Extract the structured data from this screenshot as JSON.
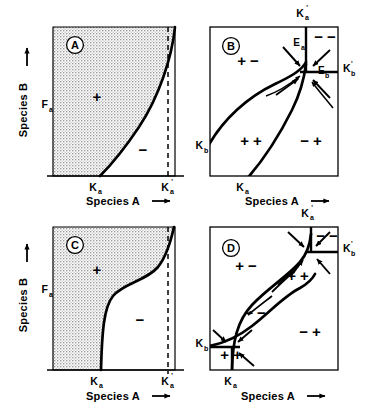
{
  "figure": {
    "type": "multi-panel-diagram",
    "panel_count": 4,
    "background_color": "#ffffff",
    "line_color": "#000000",
    "stipple_color": "#b4b4b4"
  },
  "axes": {
    "x_title": "Species A",
    "y_title": "Species B",
    "x_arrow": "⟶",
    "y_arrow": "⟶",
    "y_tick": "F",
    "y_tick_sub": "a",
    "k_a": "K",
    "k_a_sub": "a",
    "k_a_prime": "K",
    "k_a_prime_sub": "a",
    "k_a_prime_mark": "'",
    "k_b": "K",
    "k_b_sub": "b",
    "k_b_prime": "K",
    "k_b_prime_sub": "b",
    "k_b_prime_mark": "'"
  },
  "panels": [
    {
      "id": "A",
      "letter": "A",
      "kind": "single-isocline-shaded",
      "description": "Concave isocline rising from K_a on the x-axis to the top-right; region left of curve stippled and marked +, region right marked -, dashed vertical line at K'_a",
      "regions": [
        {
          "name": "positive-region",
          "sign": "+",
          "shaded": true
        },
        {
          "name": "negative-region",
          "sign": "−",
          "shaded": false
        }
      ],
      "x_ticks": [
        {
          "label": "K",
          "sub": "a",
          "prime": false
        },
        {
          "label": "K",
          "sub": "a",
          "prime": true
        }
      ],
      "y_ticks": [
        {
          "label": "F",
          "sub": "a"
        }
      ],
      "dashed_line_at": "K'_a",
      "x_title": "Species A",
      "y_title": "Species B"
    },
    {
      "id": "B",
      "letter": "B",
      "kind": "two-isoclines-stable-node",
      "description": "Two isoclines crossing at a single stable equilibrium near the top-right; four quadrant sign regions; arrows converge on the equilibrium",
      "regions": [
        {
          "name": "region-plus-minus",
          "sign": "+ −"
        },
        {
          "name": "region-minus-minus",
          "sign": "− −"
        },
        {
          "name": "region-plus-plus",
          "sign": "+ +"
        },
        {
          "name": "region-minus-plus",
          "sign": "− +"
        }
      ],
      "equilibria": [
        {
          "name": "E_a",
          "label": "E",
          "sub": "a"
        },
        {
          "name": "E_b",
          "label": "E",
          "sub": "b"
        }
      ],
      "axis_marks": [
        {
          "label": "K",
          "sub": "a",
          "prime": true,
          "position": "top"
        },
        {
          "label": "K",
          "sub": "b",
          "prime": true,
          "position": "right"
        },
        {
          "label": "K",
          "sub": "b",
          "prime": false,
          "position": "left"
        },
        {
          "label": "K",
          "sub": "a",
          "prime": false,
          "position": "bottom"
        }
      ],
      "arrow_count": 6,
      "stability": "stable",
      "x_title": "Species A",
      "y_title": "Species B"
    },
    {
      "id": "C",
      "letter": "C",
      "kind": "single-isocline-shaded-sigmoid",
      "description": "Sigmoid isocline rising from K_a with an inflection; stippled + region to the left, - region to the right, dashed vertical line at K'_a",
      "regions": [
        {
          "name": "positive-region",
          "sign": "+",
          "shaded": true
        },
        {
          "name": "negative-region",
          "sign": "−",
          "shaded": false
        }
      ],
      "x_ticks": [
        {
          "label": "K",
          "sub": "a",
          "prime": false
        },
        {
          "label": "K",
          "sub": "a",
          "prime": true
        }
      ],
      "y_ticks": [
        {
          "label": "F",
          "sub": "a"
        }
      ],
      "dashed_line_at": "K'_a",
      "x_title": "Species A",
      "y_title": "Species B"
    },
    {
      "id": "D",
      "letter": "D",
      "kind": "two-isoclines-multiple-equilibria",
      "description": "Two sigmoid isoclines crossing three times forming a lens; stable nodes at lower-left and upper-right, unstable saddle in the middle; arrows along isoclines",
      "regions": [
        {
          "name": "region-plus-minus",
          "sign": "+ −"
        },
        {
          "name": "region-minus-minus",
          "sign": "− −"
        },
        {
          "name": "region-plus-plus-lower",
          "sign": "+ +"
        },
        {
          "name": "region-plus-plus-upper",
          "sign": "+ +"
        },
        {
          "name": "region-minus-plus",
          "sign": "− +"
        },
        {
          "name": "region-minus-minus-corner",
          "sign": "− −"
        }
      ],
      "axis_marks": [
        {
          "label": "K",
          "sub": "a",
          "prime": true,
          "position": "top"
        },
        {
          "label": "K",
          "sub": "b",
          "prime": true,
          "position": "right"
        },
        {
          "label": "K",
          "sub": "b",
          "prime": false,
          "position": "left"
        },
        {
          "label": "K",
          "sub": "a",
          "prime": false,
          "position": "bottom"
        }
      ],
      "arrow_count": 10,
      "stability": "bistable",
      "x_title": "Species A",
      "y_title": "Species B"
    }
  ]
}
